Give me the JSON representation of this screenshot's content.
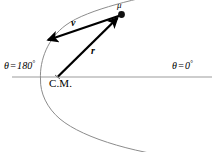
{
  "figure": {
    "background_color": "#ffffff",
    "axis_color": "#9a9a9a",
    "curve_color": "#888888",
    "vector_color": "#000000",
    "width": 216,
    "height": 152
  },
  "axis": {
    "label_left": {
      "symbol": "θ",
      "equals": "=",
      "value": "180",
      "degree": "°",
      "full": "θ = 180°"
    },
    "label_right": {
      "symbol": "θ",
      "equals": "=",
      "value": "0",
      "degree": "°",
      "full": "θ = 0°"
    }
  },
  "labels": {
    "mu": "μ",
    "velocity": "v",
    "radius": "r",
    "center_of_mass": "C.M."
  },
  "geometry": {
    "center_of_mass_point": [
      57,
      77
    ],
    "particle_point": [
      121,
      14
    ],
    "velocity_arrow_tip": [
      45,
      41
    ],
    "velocity_arrow_tail": [
      120,
      15
    ],
    "radius_arrow_tail": [
      58,
      76
    ],
    "radius_arrow_tip": [
      119,
      17
    ],
    "axis_line_y": 77,
    "axis_line_x_start": 12,
    "axis_line_x_end": 212,
    "curve_vertex": [
      40,
      78
    ]
  },
  "icons": {
    "particle_marker": "filled-dot",
    "arrowhead": "solid-triangle"
  }
}
